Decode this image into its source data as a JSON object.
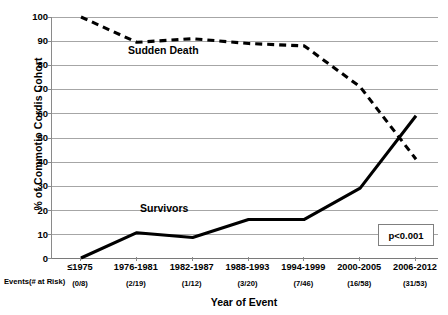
{
  "chart_data": {
    "type": "line",
    "title": "",
    "xlabel": "Year of Event",
    "ylabel": "% of Commotio Cordis Cohort",
    "ylim": [
      0,
      100
    ],
    "ytick_step": 10,
    "yticks": [
      "100",
      "90",
      "80",
      "70",
      "60",
      "50",
      "40",
      "30",
      "20",
      "10",
      "0"
    ],
    "grid": true,
    "legend": "none",
    "categories": [
      "≤1975",
      "1976-1981",
      "1982-1987",
      "1988-1993",
      "1994-1999",
      "2000-2005",
      "2006-2012"
    ],
    "events_at_risk_label": "Events(# at Risk)",
    "events_at_risk": [
      "(0/8)",
      "(2/19)",
      "(1/12)",
      "(3/20)",
      "(7/46)",
      "(16/58)",
      "(31/53)"
    ],
    "series": [
      {
        "name": "Sudden Death",
        "style": "dashed",
        "color": "#000000",
        "values": [
          100,
          89.5,
          91,
          89,
          88,
          71,
          41
        ]
      },
      {
        "name": "Survivors",
        "style": "solid",
        "color": "#000000",
        "values": [
          0,
          10.5,
          8.5,
          16,
          16,
          29,
          59
        ]
      }
    ],
    "annotations": [
      {
        "name": "sudden-death-series-label",
        "text": "Sudden Death"
      },
      {
        "name": "survivors-series-label",
        "text": "Survivors"
      },
      {
        "name": "p-value-box",
        "text": "p<0.001"
      }
    ]
  },
  "colors": {
    "gridline": "#a6a6a6",
    "axis": "#7f7f7f",
    "series": "#000000",
    "background": "#ffffff"
  }
}
